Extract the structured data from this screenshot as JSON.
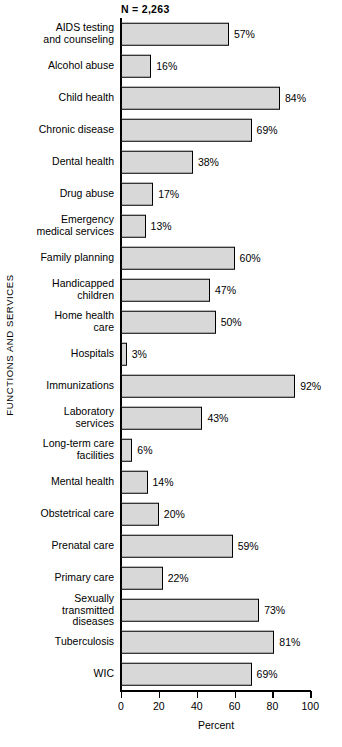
{
  "chart_data": {
    "type": "bar",
    "orientation": "horizontal",
    "title": "",
    "annotation": "N  =  2,263",
    "xlabel": "Percent",
    "ylabel": "FUNCTIONS AND SERVICES",
    "xlim": [
      0,
      100
    ],
    "xticks": [
      0,
      20,
      40,
      60,
      80,
      100
    ],
    "grid": false,
    "legend": null,
    "bar_fill_color": "#d8d8d8",
    "bar_border_color": "#000000",
    "categories": [
      "AIDS testing\nand counseling",
      "Alcohol abuse",
      "Child health",
      "Chronic disease",
      "Dental health",
      "Drug abuse",
      "Emergency\nmedical services",
      "Family planning",
      "Handicapped\nchildren",
      "Home health\ncare",
      "Hospitals",
      "Immunizations",
      "Laboratory\nservices",
      "Long-term care\nfacilities",
      "Mental health",
      "Obstetrical care",
      "Prenatal care",
      "Primary care",
      "Sexually\ntransmitted\ndiseases",
      "Tuberculosis",
      "WIC"
    ],
    "values": [
      57,
      16,
      84,
      69,
      38,
      17,
      13,
      60,
      47,
      50,
      3,
      92,
      43,
      6,
      14,
      20,
      59,
      22,
      73,
      81,
      69
    ],
    "value_labels": [
      "57%",
      "16%",
      "84%",
      "69%",
      "38%",
      "17%",
      "13%",
      "60%",
      "47%",
      "50%",
      "3%",
      "92%",
      "43%",
      "6%",
      "14%",
      "20%",
      "59%",
      "22%",
      "73%",
      "81%",
      "69%"
    ],
    "xtick_labels": [
      "0",
      "20",
      "40",
      "60",
      "80",
      "100"
    ]
  }
}
